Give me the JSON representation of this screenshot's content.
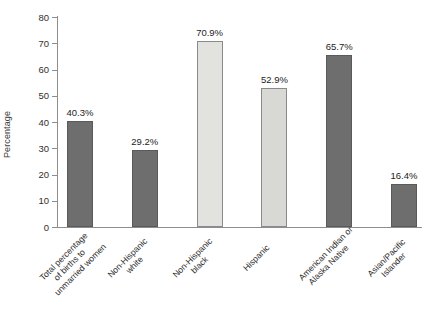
{
  "chart_data": {
    "type": "bar",
    "title": "",
    "xlabel": "",
    "ylabel": "Percentage",
    "ylim": [
      0,
      80
    ],
    "ytick_step": 10,
    "yticks": [
      "80",
      "70",
      "60",
      "50",
      "40",
      "30",
      "20",
      "10",
      "0"
    ],
    "grid": false,
    "legend": "none",
    "categories": [
      "Total percentage of births to unmarried women",
      "Non-Hispanic white",
      "Non-Hispanic black",
      "Hispanic",
      "American Indian or Alaska Native",
      "Asian/Pacific Islander"
    ],
    "category_label_lines": [
      [
        "Total percentage",
        "of births to",
        "unmarried women"
      ],
      [
        "Non-Hispanic",
        "white"
      ],
      [
        "Non-Hispanic",
        "black"
      ],
      [
        "Hispanic"
      ],
      [
        "American Indian or",
        "Alaska Native"
      ],
      [
        "Asian/Pacific",
        "Islander"
      ]
    ],
    "values": [
      40.3,
      29.2,
      70.9,
      52.9,
      65.7,
      16.4
    ],
    "value_labels": [
      "40.3%",
      "29.2%",
      "70.9%",
      "52.9%",
      "65.7%",
      "16.4%"
    ],
    "bar_colors": [
      "#6e6e6e",
      "#6e6e6e",
      "#e2e2de",
      "#d8d8d4",
      "#6e6e6e",
      "#6e6e6e"
    ],
    "bar_styles": [
      "dark",
      "dark",
      "light",
      "light2",
      "dark",
      "dark"
    ],
    "axis_color": "#8d8d8d",
    "text_color": "#262626",
    "background": "#ffffff"
  }
}
